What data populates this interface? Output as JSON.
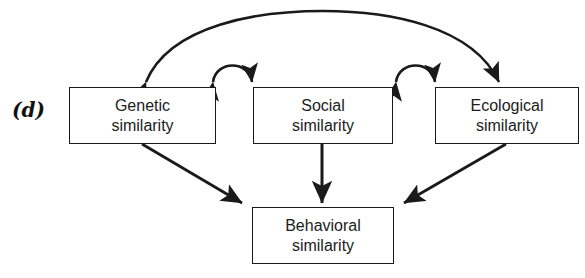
{
  "figure": {
    "panel_label": "(d)",
    "type": "path-diagram",
    "background_color": "#ffffff",
    "stroke_color": "#1a1a1a",
    "text_color": "#1c1c1c"
  },
  "nodes": {
    "genetic": {
      "line1": "Genetic",
      "line2": "similarity"
    },
    "social": {
      "line1": "Social",
      "line2": "similarity"
    },
    "ecological": {
      "line1": "Ecological",
      "line2": "similarity"
    },
    "behavioral": {
      "line1": "Behavioral",
      "line2": "similarity"
    }
  },
  "edges": [
    {
      "name": "genetic-ecological-bidirectional-arc",
      "from": "ecological",
      "to": "genetic",
      "style": "curved",
      "heads": "double",
      "position": "top-outer"
    },
    {
      "name": "genetic-social-bidirectional-arc",
      "from": "genetic",
      "to": "social",
      "style": "curved",
      "heads": "double",
      "position": "top-inner-left"
    },
    {
      "name": "social-ecological-bidirectional-arc",
      "from": "social",
      "to": "ecological",
      "style": "curved",
      "heads": "double",
      "position": "top-inner-right"
    },
    {
      "name": "genetic-to-behavioral-arrow",
      "from": "genetic",
      "to": "behavioral",
      "style": "straight",
      "heads": "single"
    },
    {
      "name": "social-to-behavioral-arrow",
      "from": "social",
      "to": "behavioral",
      "style": "straight",
      "heads": "single"
    },
    {
      "name": "ecological-to-behavioral-arrow",
      "from": "ecological",
      "to": "behavioral",
      "style": "straight",
      "heads": "single"
    }
  ]
}
